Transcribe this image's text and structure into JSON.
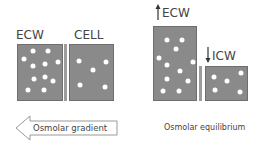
{
  "left_panel": {
    "ecw_label": "ECW",
    "cell_label": "CELL",
    "ecw_dots": [
      [
        33,
        51
      ],
      [
        48,
        51
      ],
      [
        24,
        59
      ],
      [
        33,
        66
      ],
      [
        45,
        64
      ],
      [
        58,
        62
      ],
      [
        34,
        79
      ],
      [
        45,
        77
      ],
      [
        53,
        81
      ],
      [
        28,
        90
      ],
      [
        44,
        90
      ]
    ],
    "cell_dots": [
      [
        79,
        61
      ],
      [
        106,
        62
      ],
      [
        93,
        70
      ],
      [
        80,
        85
      ],
      [
        105,
        87
      ]
    ],
    "arrow_label": "Osmolar gradient"
  },
  "right_panel": {
    "ecw_label": "ECW",
    "icw_label": "ICW",
    "ecw_dots": [
      [
        167,
        40
      ],
      [
        182,
        40
      ],
      [
        176,
        49
      ],
      [
        159,
        58
      ],
      [
        167,
        65
      ],
      [
        193,
        62
      ],
      [
        180,
        71
      ],
      [
        167,
        79
      ],
      [
        188,
        81
      ],
      [
        163,
        91
      ],
      [
        179,
        91
      ]
    ],
    "icw_dots": [
      [
        214,
        77
      ],
      [
        227,
        81
      ],
      [
        241,
        73
      ],
      [
        215,
        90
      ],
      [
        240,
        92
      ]
    ],
    "caption": "Osmolar equilibrium"
  },
  "colors": {
    "box_fill": "#8a8a8a",
    "dot": "#ffffff",
    "text": "#444444"
  }
}
